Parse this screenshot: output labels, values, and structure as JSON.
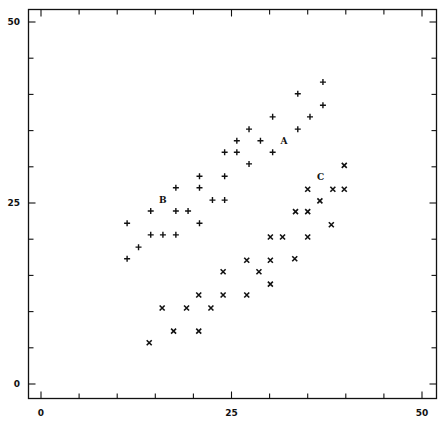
{
  "chart_data": {
    "type": "scatter",
    "title": "",
    "xlabel": "",
    "ylabel": "",
    "xlim": [
      0,
      50
    ],
    "ylim": [
      0,
      50
    ],
    "grid": false,
    "legend": "none (series labelled inline: A, B, C)",
    "x_ticks_major": [
      0,
      25,
      50
    ],
    "y_ticks_major": [
      0,
      25,
      50
    ],
    "minor_tick_step": 5,
    "annotations": [
      {
        "text": "A",
        "x": 31.9,
        "y": 33.6
      },
      {
        "text": "B",
        "x": 16.0,
        "y": 25.4
      },
      {
        "text": "C",
        "x": 36.7,
        "y": 28.6
      }
    ],
    "series": [
      {
        "name": "A/B",
        "marker": "+",
        "points": [
          [
            11.3,
            22.2
          ],
          [
            11.3,
            17.3
          ],
          [
            12.8,
            18.9
          ],
          [
            14.4,
            23.9
          ],
          [
            14.4,
            20.6
          ],
          [
            16.0,
            20.6
          ],
          [
            17.7,
            20.6
          ],
          [
            17.7,
            23.9
          ],
          [
            19.3,
            23.9
          ],
          [
            17.7,
            27.1
          ],
          [
            20.8,
            28.7
          ],
          [
            20.8,
            27.1
          ],
          [
            20.8,
            22.2
          ],
          [
            22.5,
            25.4
          ],
          [
            24.1,
            25.4
          ],
          [
            24.1,
            28.7
          ],
          [
            25.7,
            32.0
          ],
          [
            24.1,
            32.0
          ],
          [
            27.3,
            30.4
          ],
          [
            28.8,
            33.6
          ],
          [
            25.7,
            33.6
          ],
          [
            27.3,
            35.2
          ],
          [
            30.4,
            32.0
          ],
          [
            30.4,
            36.9
          ],
          [
            33.7,
            35.2
          ],
          [
            35.3,
            36.9
          ],
          [
            33.7,
            40.1
          ],
          [
            37.0,
            38.5
          ],
          [
            37.0,
            41.7
          ]
        ]
      },
      {
        "name": "C",
        "marker": "x",
        "points": [
          [
            14.2,
            5.7
          ],
          [
            15.9,
            10.5
          ],
          [
            17.4,
            7.3
          ],
          [
            19.1,
            10.5
          ],
          [
            20.7,
            7.3
          ],
          [
            20.7,
            12.3
          ],
          [
            22.3,
            10.5
          ],
          [
            23.9,
            12.3
          ],
          [
            23.9,
            15.5
          ],
          [
            27.0,
            12.3
          ],
          [
            27.0,
            17.1
          ],
          [
            28.6,
            15.5
          ],
          [
            30.1,
            17.1
          ],
          [
            30.1,
            13.8
          ],
          [
            30.1,
            20.3
          ],
          [
            31.7,
            20.3
          ],
          [
            33.3,
            17.3
          ],
          [
            35.0,
            20.3
          ],
          [
            33.4,
            23.8
          ],
          [
            35.0,
            23.8
          ],
          [
            36.6,
            25.3
          ],
          [
            38.1,
            22.0
          ],
          [
            35.0,
            26.9
          ],
          [
            38.3,
            26.9
          ],
          [
            39.8,
            26.9
          ],
          [
            39.8,
            30.2
          ]
        ]
      }
    ]
  },
  "layout_colors": {
    "background": "#ffffff",
    "ink": "#111111"
  }
}
